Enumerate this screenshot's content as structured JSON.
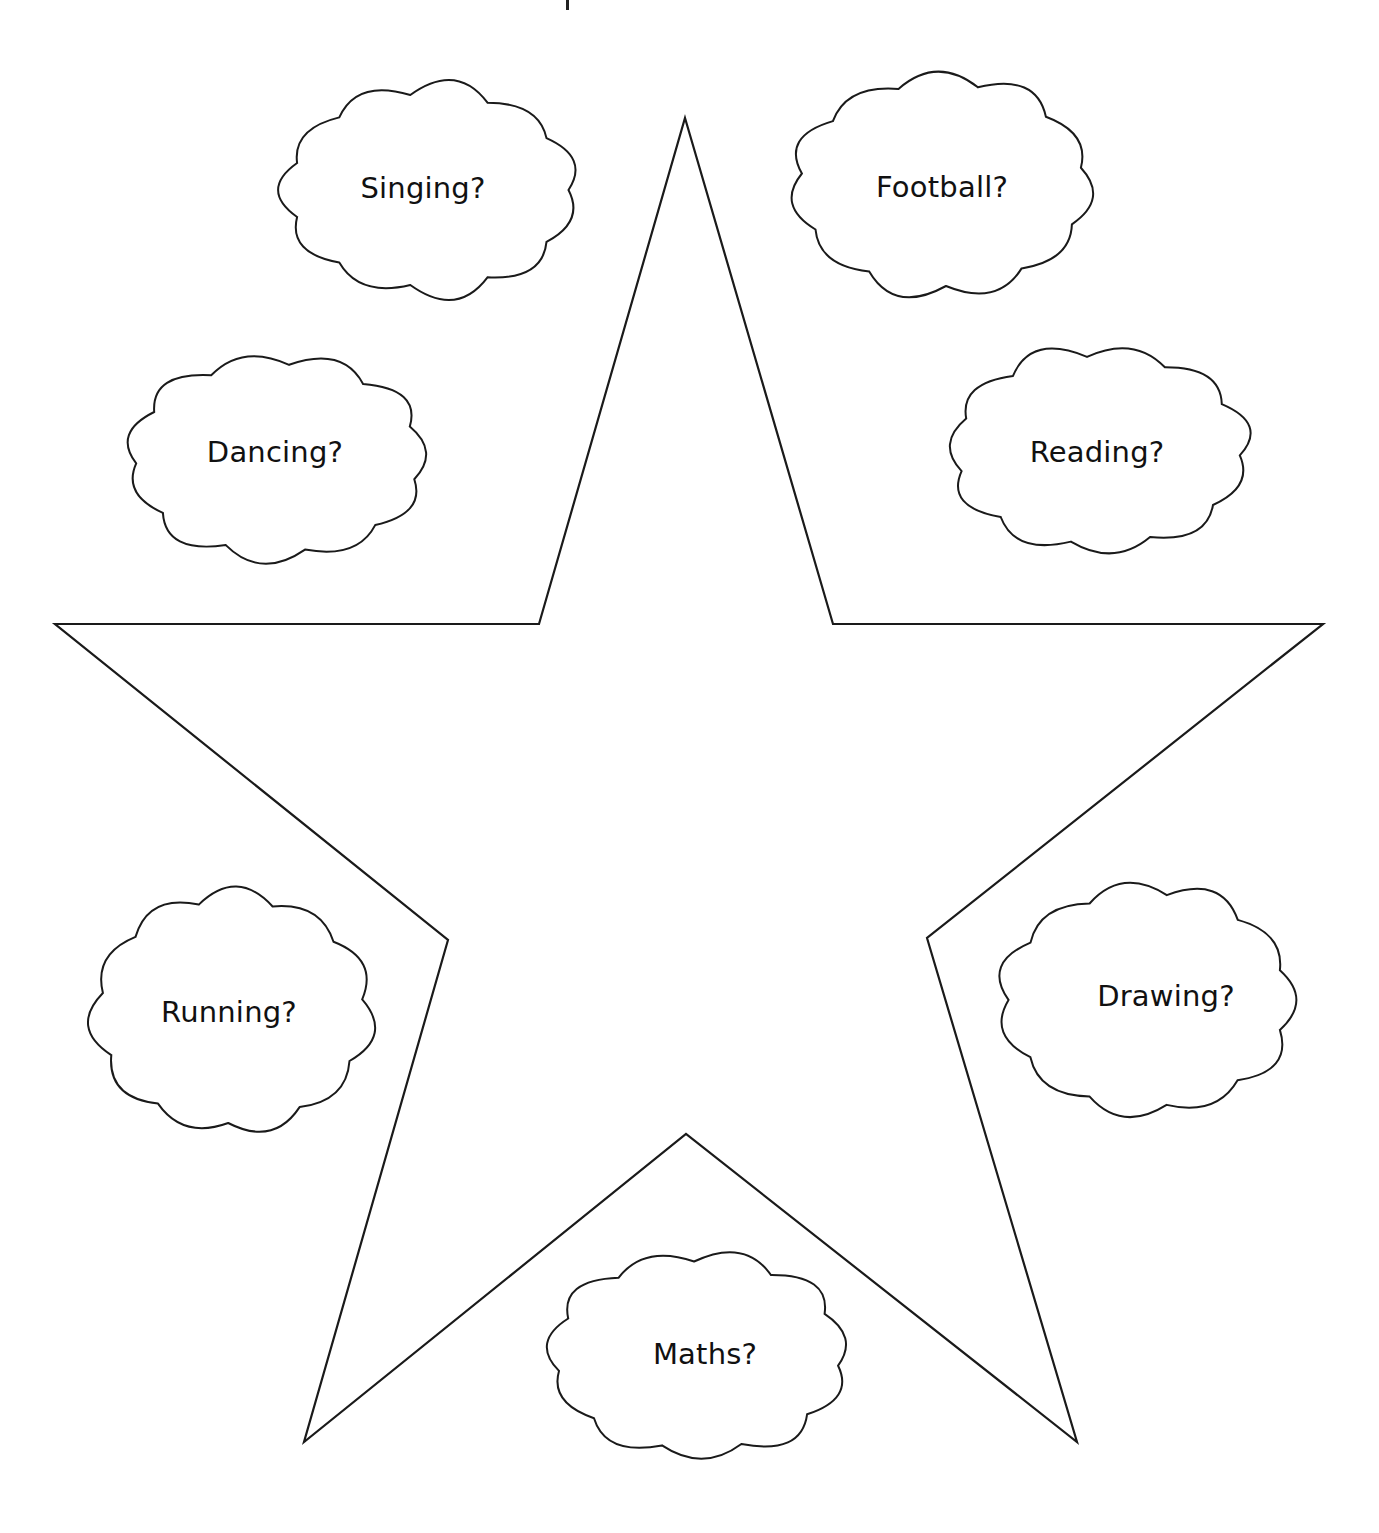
{
  "worksheet": {
    "title_fragment_visible": true,
    "star": {
      "stroke": "#1a1a1a",
      "fill": "#ffffff",
      "points": [
        [
          685,
          118
        ],
        [
          833,
          624
        ],
        [
          1323,
          624
        ],
        [
          927,
          938
        ],
        [
          1077,
          1442
        ],
        [
          686,
          1134
        ],
        [
          304,
          1442
        ],
        [
          448,
          940
        ],
        [
          55,
          624
        ],
        [
          539,
          624
        ]
      ]
    },
    "clouds": [
      {
        "id": "singing",
        "label": "Singing?",
        "cx": 430,
        "cy": 190,
        "w": 305,
        "h": 220,
        "text_x": 423,
        "text_y": 188
      },
      {
        "id": "football",
        "label": "Football?",
        "cx": 942,
        "cy": 185,
        "w": 310,
        "h": 230,
        "text_x": 942,
        "text_y": 187
      },
      {
        "id": "dancing",
        "label": "Dancing?",
        "cx": 277,
        "cy": 458,
        "w": 310,
        "h": 215,
        "text_x": 275,
        "text_y": 452
      },
      {
        "id": "reading",
        "label": "Reading?",
        "cx": 1099,
        "cy": 450,
        "w": 310,
        "h": 215,
        "text_x": 1097,
        "text_y": 452
      },
      {
        "id": "running",
        "label": "Running?",
        "cx": 232,
        "cy": 1012,
        "w": 290,
        "h": 250,
        "text_x": 229,
        "text_y": 1012
      },
      {
        "id": "drawing",
        "label": "Drawing?",
        "cx": 1147,
        "cy": 1000,
        "w": 305,
        "h": 240,
        "text_x": 1166,
        "text_y": 996
      },
      {
        "id": "maths",
        "label": "Maths?",
        "cx": 698,
        "cy": 1355,
        "w": 310,
        "h": 215,
        "text_x": 705,
        "text_y": 1354
      }
    ]
  }
}
